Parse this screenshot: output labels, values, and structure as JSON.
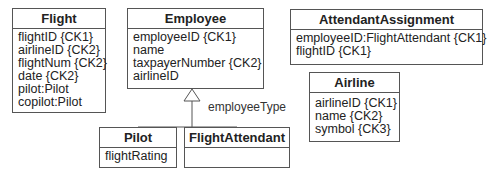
{
  "classes": {
    "flight": {
      "name": "Flight",
      "attributes": [
        "flightID {CK1}",
        "airlineID {CK2}",
        "flightNum {CK2}",
        "date {CK2}",
        "pilot:Pilot",
        "copilot:Pilot"
      ]
    },
    "employee": {
      "name": "Employee",
      "attributes": [
        "employeeID {CK1}",
        "name",
        "taxpayerNumber {CK2}",
        "airlineID"
      ]
    },
    "attendantAssignment": {
      "name": "AttendantAssignment",
      "attributes": [
        "employeeID:FlightAttendant {CK1}",
        "flightID {CK1}"
      ]
    },
    "airline": {
      "name": "Airline",
      "attributes": [
        "airlineID {CK1}",
        "name {CK2}",
        "symbol {CK3}"
      ]
    },
    "pilot": {
      "name": "Pilot",
      "attributes": [
        "flightRating"
      ]
    },
    "flightAttendant": {
      "name": "FlightAttendant",
      "attributes": []
    }
  },
  "generalization": {
    "discriminator": "employeeType",
    "parent": "Employee",
    "children": [
      "Pilot",
      "FlightAttendant"
    ]
  }
}
